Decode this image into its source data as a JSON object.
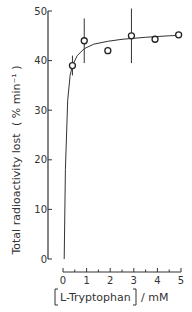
{
  "chart_data": {
    "type": "scatter",
    "title": "",
    "xlabel": "[L-Tryptophan] / mM",
    "ylabel": "Total radioactivity lost (% min⁻¹)",
    "xlim": [
      0,
      5
    ],
    "ylim": [
      0,
      50
    ],
    "xticks": [
      0,
      1,
      2,
      3,
      4,
      5
    ],
    "yticks": [
      0,
      10,
      20,
      30,
      40,
      50
    ],
    "grid": false,
    "legend": null,
    "series": [
      {
        "name": "observed",
        "marker": "open-circle",
        "x": [
          0.4,
          0.9,
          1.9,
          2.9,
          3.9,
          4.9
        ],
        "y": [
          39,
          44,
          42,
          45,
          44.3,
          45.2
        ],
        "error": [
          2,
          4.5,
          0,
          5.5,
          0,
          0
        ]
      },
      {
        "name": "fitted-curve",
        "type": "line",
        "x": [
          0.05,
          0.1,
          0.2,
          0.3,
          0.4,
          0.6,
          0.9,
          1.3,
          1.9,
          2.5,
          3.0,
          3.5,
          4.0,
          4.5,
          5.0
        ],
        "y": [
          0,
          18,
          32,
          37,
          39,
          41,
          42.4,
          43.3,
          43.9,
          44.3,
          44.5,
          44.7,
          44.85,
          45.0,
          45.1
        ]
      }
    ]
  },
  "labels": {
    "ylabel_main": "Total radioactivity lost",
    "ylabel_unit": "( % min⁻¹ )",
    "xlabel_bracket_text": "L-Tryptophan",
    "xlabel_unit": "/ mM",
    "yticks": [
      "0",
      "10",
      "20",
      "30",
      "40",
      "50"
    ],
    "xticks": [
      "0",
      "1",
      "2",
      "3",
      "4",
      "5"
    ]
  }
}
